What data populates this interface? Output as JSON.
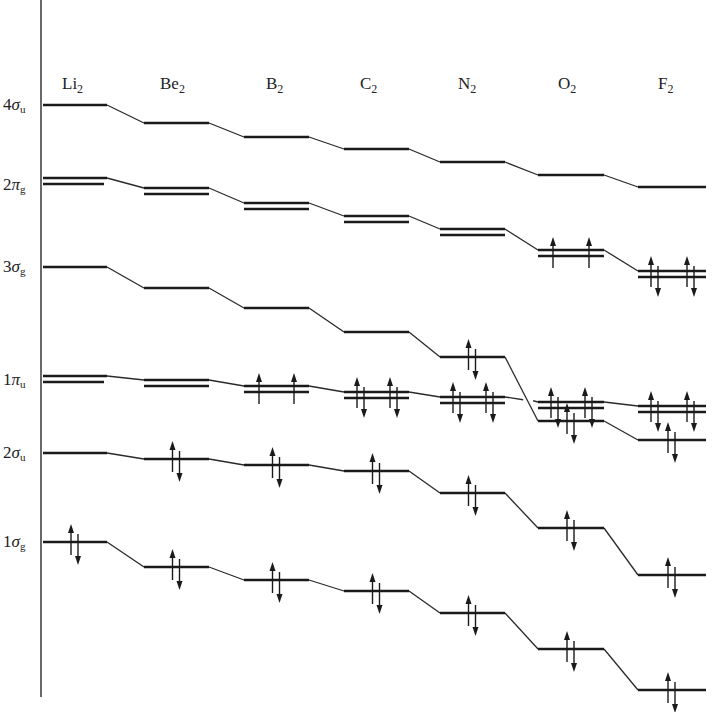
{
  "diagram": {
    "colors": {
      "ink": "#1a1a1a",
      "background": "#ffffff"
    },
    "axis": {
      "x": 41,
      "y_top": 0,
      "y_bottom": 697
    },
    "molecules": [
      {
        "id": "Li2",
        "base": "Li",
        "sub": "2",
        "label_x": 62,
        "x1": 43,
        "x2": 107
      },
      {
        "id": "Be2",
        "base": "Be",
        "sub": "2",
        "label_x": 160,
        "x1": 144,
        "x2": 209
      },
      {
        "id": "B2",
        "base": "B",
        "sub": "2",
        "label_x": 266,
        "x1": 244,
        "x2": 309
      },
      {
        "id": "C2",
        "base": "C",
        "sub": "2",
        "label_x": 360,
        "x1": 344,
        "x2": 409
      },
      {
        "id": "N2",
        "base": "N",
        "sub": "2",
        "label_x": 458,
        "x1": 440,
        "x2": 505
      },
      {
        "id": "O2",
        "base": "O",
        "sub": "2",
        "label_x": 558,
        "x1": 538,
        "x2": 604
      },
      {
        "id": "F2",
        "base": "F",
        "sub": "2",
        "label_x": 658,
        "x1": 638,
        "x2": 706
      }
    ],
    "molecule_label_y": 89,
    "orbitals": [
      {
        "id": "4su",
        "number": "4",
        "greek": "σ",
        "sub": "u",
        "label_y": 110,
        "degenerate": false,
        "y": [
          105,
          123,
          137,
          149,
          162,
          175,
          187
        ],
        "electrons": [
          "",
          "",
          "",
          "",
          "",
          "",
          ""
        ]
      },
      {
        "id": "2pg",
        "number": "2",
        "greek": "π",
        "sub": "g",
        "label_y": 190,
        "degenerate": true,
        "y": [
          181,
          191,
          206,
          219,
          232,
          253,
          274
        ],
        "electrons": [
          "",
          "",
          "",
          "",
          "",
          "up-up",
          "pair-pair"
        ]
      },
      {
        "id": "3sg",
        "number": "3",
        "greek": "σ",
        "sub": "g",
        "label_y": 272,
        "degenerate": false,
        "y": [
          267,
          288,
          308,
          332,
          357,
          421,
          440
        ],
        "electrons": [
          "",
          "",
          "",
          "",
          "pair",
          "pair",
          "pair"
        ]
      },
      {
        "id": "1pu",
        "number": "1",
        "greek": "π",
        "sub": "u",
        "label_y": 385,
        "degenerate": true,
        "y": [
          379,
          383,
          389,
          395,
          400,
          405,
          409
        ],
        "electrons": [
          "",
          "",
          "up-up",
          "pair-pair",
          "pair-pair",
          "pair-pair",
          "pair-pair"
        ]
      },
      {
        "id": "2su",
        "number": "2",
        "greek": "σ",
        "sub": "u",
        "label_y": 458,
        "degenerate": false,
        "y": [
          453,
          459,
          465,
          471,
          493,
          528,
          575
        ],
        "electrons": [
          "",
          "pair",
          "pair",
          "pair",
          "pair",
          "pair",
          "pair"
        ]
      },
      {
        "id": "1sg",
        "number": "1",
        "greek": "σ",
        "sub": "g",
        "label_y": 547,
        "degenerate": false,
        "y": [
          542,
          567,
          580,
          591,
          613,
          649,
          690
        ],
        "electrons": [
          "pair",
          "pair",
          "pair",
          "pair",
          "pair",
          "pair",
          "pair"
        ]
      }
    ]
  }
}
